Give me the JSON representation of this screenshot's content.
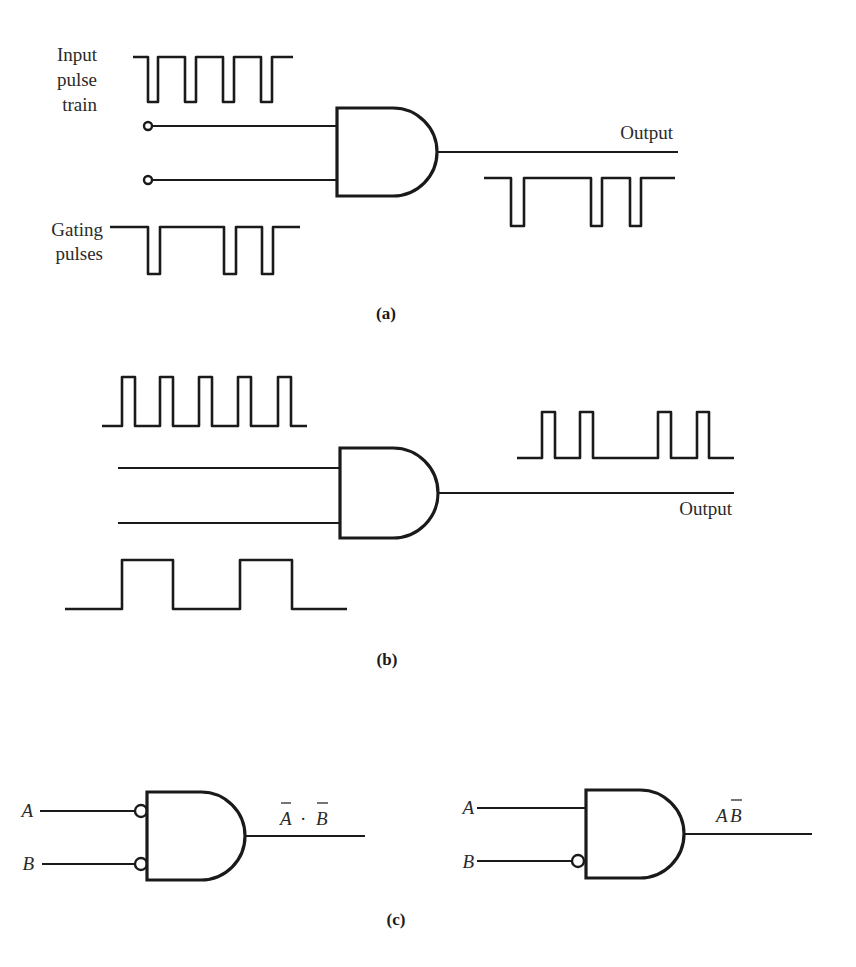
{
  "panels": {
    "a": {
      "caption": "(a)",
      "input_label_lines": [
        "Input",
        "pulse",
        "train"
      ],
      "gating_label_lines": [
        "Gating",
        "pulses"
      ],
      "output_label": "Output",
      "gate_type": "AND",
      "input_pulse_train": {
        "polarity": "active-low",
        "pulses": 4
      },
      "gating_pulses": {
        "polarity": "active-low",
        "pulses": 3
      },
      "output_waveform": {
        "polarity": "active-low",
        "pulses": 3
      }
    },
    "b": {
      "caption": "(b)",
      "output_label": "Output",
      "gate_type": "AND",
      "input_pulse_train": {
        "polarity": "active-high",
        "pulses": 5
      },
      "gating_pulses": {
        "polarity": "active-high",
        "pulses": 2
      },
      "output_waveform": {
        "polarity": "active-high",
        "pulses": 4
      }
    },
    "c": {
      "caption": "(c)",
      "left_gate": {
        "input_a": "A",
        "input_b": "B",
        "inverted_inputs": [
          "A",
          "B"
        ],
        "output_expr": {
          "a": "A",
          "dot": "·",
          "b": "B",
          "a_overbar": true,
          "b_overbar": true
        }
      },
      "right_gate": {
        "input_a": "A",
        "input_b": "B",
        "inverted_inputs": [
          "B"
        ],
        "output_expr": {
          "a": "A",
          "b": "B",
          "a_overbar": false,
          "b_overbar": true
        }
      }
    }
  }
}
